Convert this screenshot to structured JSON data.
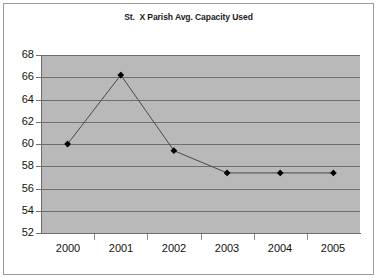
{
  "chart_data": {
    "type": "line",
    "title": "St.  X Parish Avg. Capacity Used",
    "xlabel": "",
    "ylabel": "",
    "categories": [
      "2000",
      "2001",
      "2002",
      "2003",
      "2004",
      "2005"
    ],
    "x": [
      2000,
      2001,
      2002,
      2003,
      2004,
      2005
    ],
    "values": [
      60.0,
      66.2,
      59.4,
      57.4,
      57.4,
      57.4
    ],
    "series": [
      {
        "name": "Avg. Capacity Used",
        "values": [
          60.0,
          66.2,
          59.4,
          57.4,
          57.4,
          57.4
        ]
      }
    ],
    "ylim": [
      52,
      68
    ],
    "yticks": [
      52,
      54,
      56,
      58,
      60,
      62,
      64,
      66,
      68
    ],
    "ytick_labels": [
      "52",
      "54",
      "56",
      "58",
      "60",
      "62",
      "64",
      "66",
      "68"
    ],
    "xtick_labels": [
      "2000",
      "2001",
      "2002",
      "2003",
      "2004",
      "2005"
    ],
    "grid": "horizontal",
    "legend": "none",
    "marker": "filled-diamond",
    "colors": {
      "plot_background": "#b9b9b9",
      "page_background": "#ffffff",
      "gridline": "#6f6f6f",
      "line": "#4a4a4a",
      "marker": "#000000",
      "axis": "#6f6f6f",
      "text": "#111111",
      "frame_border": "#9a9a9a"
    }
  }
}
